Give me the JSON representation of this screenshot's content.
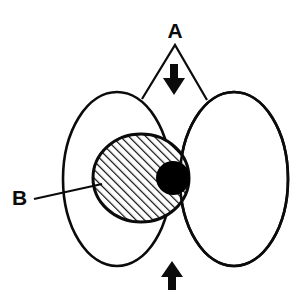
{
  "figure": {
    "background_color": "#ffffff",
    "stroke_color": "#0b0b0b",
    "fill_solid_color": "#000000",
    "hatch_color": "#0b0b0b",
    "width": 304,
    "height": 296
  },
  "labels": {
    "a": {
      "text": "A",
      "x": 175,
      "y": 38,
      "leader": "two-branch-v",
      "leader_apex": {
        "x": 175,
        "y": 45
      },
      "leader_endpoints": [
        {
          "x": 142,
          "y": 99
        },
        {
          "x": 207,
          "y": 100
        }
      ]
    },
    "b": {
      "text": "B",
      "x": 12,
      "y": 205,
      "leader": "single-line",
      "leader_start": {
        "x": 34,
        "y": 199
      },
      "leader_end": {
        "x": 102,
        "y": 184
      }
    }
  },
  "shapes": {
    "left_ellipse": {
      "cx": 117,
      "cy": 179,
      "rx": 54,
      "ry": 87
    },
    "right_ellipse": {
      "cx": 234,
      "cy": 179,
      "rx": 54,
      "ry": 87
    },
    "hatched_ellipse": {
      "cx": 141,
      "cy": 178,
      "rx": 48,
      "ry": 44,
      "pattern": "diagonal-hatch"
    },
    "solid_circle": {
      "cx": 173,
      "cy": 178,
      "r": 17
    }
  },
  "arrows": {
    "down_arrow": {
      "name": "down-arrow",
      "direction": "down",
      "x": 175,
      "y_top": 65,
      "y_bottom": 95
    },
    "up_arrow": {
      "name": "up-arrow",
      "direction": "up",
      "x": 172,
      "y_top": 262,
      "y_bottom": 290
    }
  }
}
